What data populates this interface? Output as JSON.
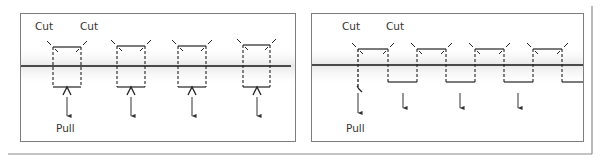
{
  "figure": {
    "outer_frame": {
      "x": 8,
      "y": 6,
      "right": 592,
      "bottom": 154,
      "color": "#8a8a8a"
    },
    "colors": {
      "panel_border": "#7d7d7d",
      "centerline": "#4a4a4a",
      "centerline_shadow": "#d9d9d9",
      "dashed": "#222222",
      "solid": "#222222",
      "arrow": "#333333",
      "text": "#333333"
    }
  },
  "left_panel": {
    "name": "Cut on both sides, pull center",
    "frame": {
      "x": 20,
      "y": 13,
      "w": 275,
      "h": 128
    },
    "centerline_y": 66,
    "centerline_x": [
      21,
      291
    ],
    "labels": {
      "cut_left": "Cut",
      "cut_right": "Cut",
      "pull": "Pull"
    },
    "label_positions": {
      "cut_left": {
        "x": 35,
        "y": 30
      },
      "cut_right": {
        "x": 80,
        "y": 30
      },
      "pull": {
        "x": 56,
        "y": 132
      }
    },
    "units": [
      {
        "x1": 53,
        "x2": 81,
        "top": 47,
        "bottom": 87,
        "arrow_x": 67
      },
      {
        "x1": 117,
        "x2": 145,
        "top": 46,
        "bottom": 87,
        "arrow_x": 131
      },
      {
        "x1": 178,
        "x2": 206,
        "top": 46,
        "bottom": 87,
        "arrow_x": 192
      },
      {
        "x1": 243,
        "x2": 270,
        "top": 45,
        "bottom": 87,
        "arrow_x": 257
      }
    ],
    "arrow": {
      "y1": 97,
      "y2": 116
    }
  },
  "right_panel": {
    "name": "Alternating cuts, continuous strip pull",
    "frame": {
      "x": 311,
      "y": 13,
      "w": 272,
      "h": 128
    },
    "centerline_y": 65,
    "centerline_x": [
      312,
      583
    ],
    "labels": {
      "cut_left": "Cut",
      "cut_right": "Cut",
      "pull": "Pull"
    },
    "label_positions": {
      "cut_left": {
        "x": 342,
        "y": 30
      },
      "cut_right": {
        "x": 386,
        "y": 30
      },
      "pull": {
        "x": 346,
        "y": 132
      }
    },
    "top_segments": [
      {
        "x1": 358,
        "x2": 388,
        "y": 49
      },
      {
        "x1": 417,
        "x2": 446,
        "y": 49
      },
      {
        "x1": 475,
        "x2": 504,
        "y": 49
      },
      {
        "x1": 533,
        "x2": 562,
        "y": 49
      }
    ],
    "bottom_segments": [
      {
        "x1": 388,
        "x2": 417,
        "y": 82
      },
      {
        "x1": 446,
        "x2": 475,
        "y": 82
      },
      {
        "x1": 504,
        "x2": 533,
        "y": 82
      },
      {
        "x1": 562,
        "x2": 583,
        "y": 82
      }
    ],
    "pull_arrow": {
      "x": 358,
      "hook_y": 89,
      "y1": 93,
      "y2": 113
    },
    "arrows": [
      {
        "x": 403,
        "y1": 93,
        "y2": 108
      },
      {
        "x": 460,
        "y1": 93,
        "y2": 108
      },
      {
        "x": 518,
        "y1": 93,
        "y2": 108
      }
    ]
  }
}
